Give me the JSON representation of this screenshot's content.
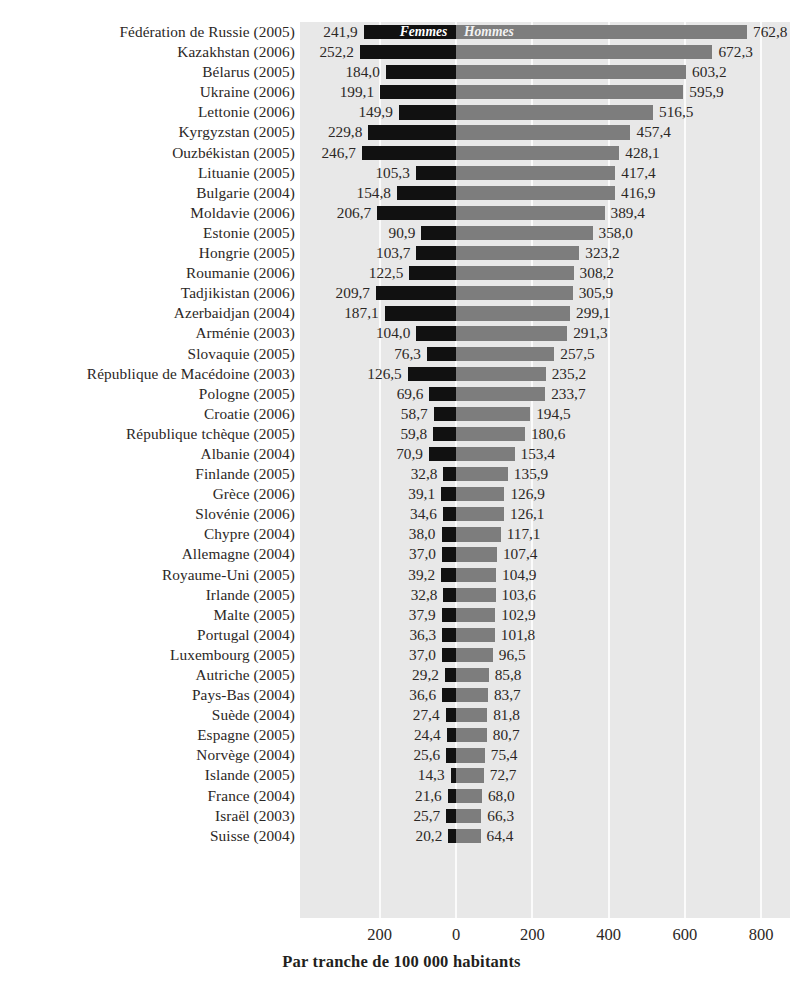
{
  "chart_data": {
    "type": "bar",
    "orientation": "horizontal",
    "style": "diverging-bidirectional",
    "title": "",
    "xlabel": "Par tranche de 100 000 habitants",
    "ylabel": "",
    "xlim": [
      -300,
      800
    ],
    "xticks": [
      -200,
      0,
      200,
      400,
      600,
      800
    ],
    "xtick_labels": [
      "200",
      "0",
      "200",
      "400",
      "600",
      "800"
    ],
    "grid": true,
    "legend": [
      "Femmes",
      "Hommes"
    ],
    "legend_position": "inside-first-bar",
    "series": [
      {
        "name": "Femmes",
        "color": "#111111",
        "direction": "left"
      },
      {
        "name": "Hommes",
        "color": "#7d7d7d",
        "direction": "right"
      }
    ],
    "categories": [
      "Fédération de Russie (2005)",
      "Kazakhstan (2006)",
      "Bélarus (2005)",
      "Ukraine (2006)",
      "Lettonie (2006)",
      "Kyrgyzstan (2005)",
      "Ouzbékistan (2005)",
      "Lituanie (2005)",
      "Bulgarie (2004)",
      "Moldavie (2006)",
      "Estonie (2005)",
      "Hongrie (2005)",
      "Roumanie (2006)",
      "Tadjikistan (2006)",
      "Azerbaidjan (2004)",
      "Arménie (2003)",
      "Slovaquie (2005)",
      "République de Macédoine (2003)",
      "Pologne (2005)",
      "Croatie (2006)",
      "République tchèque (2005)",
      "Albanie (2004)",
      "Finlande (2005)",
      "Grèce (2006)",
      "Slovénie (2006)",
      "Chypre (2004)",
      "Allemagne (2004)",
      "Royaume-Uni (2005)",
      "Irlande (2005)",
      "Malte (2005)",
      "Portugal (2004)",
      "Luxembourg (2005)",
      "Autriche (2005)",
      "Pays-Bas (2004)",
      "Suède (2004)",
      "Espagne (2005)",
      "Norvège (2004)",
      "Islande (2005)",
      "France (2004)",
      "Israël (2003)",
      "Suisse (2004)"
    ],
    "femmes_values": [
      241.9,
      252.2,
      184.0,
      199.1,
      149.9,
      229.8,
      246.7,
      105.3,
      154.8,
      206.7,
      90.9,
      103.7,
      122.5,
      209.7,
      187.1,
      104.0,
      76.3,
      126.5,
      69.6,
      58.7,
      59.8,
      70.9,
      32.8,
      39.1,
      34.6,
      38.0,
      37.0,
      39.2,
      32.8,
      37.9,
      36.3,
      37.0,
      29.2,
      36.6,
      27.4,
      24.4,
      25.6,
      14.3,
      21.6,
      25.7,
      20.2
    ],
    "hommes_values": [
      762.8,
      672.3,
      603.2,
      595.9,
      516.5,
      457.4,
      428.1,
      417.4,
      416.9,
      389.4,
      358.0,
      323.2,
      308.2,
      305.9,
      299.1,
      291.3,
      257.5,
      235.2,
      233.7,
      194.5,
      180.6,
      153.4,
      135.9,
      126.9,
      126.1,
      117.1,
      107.4,
      104.9,
      103.6,
      102.9,
      101.8,
      96.5,
      85.8,
      83.7,
      81.8,
      80.7,
      75.4,
      72.7,
      68.0,
      66.3,
      64.4
    ],
    "femmes_labels": [
      "241,9",
      "252,2",
      "184,0",
      "199,1",
      "149,9",
      "229,8",
      "246,7",
      "105,3",
      "154,8",
      "206,7",
      "90,9",
      "103,7",
      "122,5",
      "209,7",
      "187,1",
      "104,0",
      "76,3",
      "126,5",
      "69,6",
      "58,7",
      "59,8",
      "70,9",
      "32,8",
      "39,1",
      "34,6",
      "38,0",
      "37,0",
      "39,2",
      "32,8",
      "37,9",
      "36,3",
      "37,0",
      "29,2",
      "36,6",
      "27,4",
      "24,4",
      "25,6",
      "14,3",
      "21,6",
      "25,7",
      "20,2"
    ],
    "hommes_labels": [
      "762,8",
      "672,3",
      "603,2",
      "595,9",
      "516,5",
      "457,4",
      "428,1",
      "417,4",
      "416,9",
      "389,4",
      "358,0",
      "323,2",
      "308,2",
      "305,9",
      "299,1",
      "291,3",
      "257,5",
      "235,2",
      "233,7",
      "194,5",
      "180,6",
      "153,4",
      "135,9",
      "126,9",
      "126,1",
      "117,1",
      "107,4",
      "104,9",
      "103,6",
      "102,9",
      "101,8",
      "96,5",
      "85,8",
      "83,7",
      "81,8",
      "80,7",
      "75,4",
      "72,7",
      "68,0",
      "66,3",
      "64,4"
    ]
  },
  "colors": {
    "femmes": "#111111",
    "hommes": "#7d7d7d",
    "panel": "#e8e8e8",
    "grid": "#fbfbfb",
    "text": "#231f20"
  }
}
